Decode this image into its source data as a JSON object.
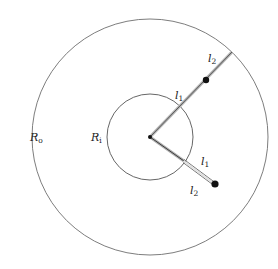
{
  "diagram": {
    "type": "concentric-circles-with-rods",
    "center": {
      "x": 150,
      "y": 137
    },
    "outer_circle": {
      "label_main": "R",
      "label_sub": "o",
      "radius": 118
    },
    "inner_circle": {
      "label_main": "R",
      "label_sub": "i",
      "radius": 43
    },
    "rods": [
      {
        "name": "upper-rod",
        "end": {
          "x": 232,
          "y": 52
        },
        "bead": {
          "x": 206,
          "y": 80
        },
        "labels": [
          {
            "main": "l",
            "sub": "1",
            "x": 175,
            "y": 99
          },
          {
            "main": "l",
            "sub": "2",
            "x": 208,
            "y": 62
          }
        ]
      },
      {
        "name": "lower-rod",
        "end": {
          "x": 215,
          "y": 184
        },
        "bead": {
          "x": 215,
          "y": 184
        },
        "labels": [
          {
            "main": "l",
            "sub": "1",
            "x": 201,
            "y": 165
          },
          {
            "main": "l",
            "sub": "2",
            "x": 190,
            "y": 194
          }
        ]
      }
    ],
    "colors": {
      "circle_stroke": "#6e6e6e",
      "rod_stroke": "#9a9a9a",
      "bead_fill": "#111111",
      "text": "#222222"
    }
  }
}
